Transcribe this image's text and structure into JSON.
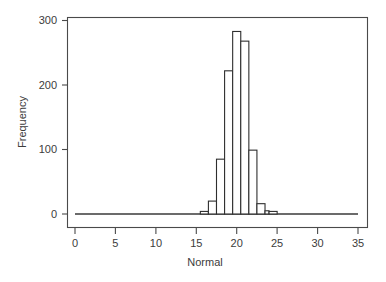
{
  "chart_data": {
    "type": "bar",
    "title": "",
    "subtitle": "",
    "xlabel": "Normal",
    "ylabel": "Frequency",
    "xlim": [
      0,
      35
    ],
    "ylim": [
      0,
      300
    ],
    "grid": false,
    "legend": null,
    "xticks": [
      0,
      5,
      10,
      15,
      20,
      25,
      30,
      35
    ],
    "xtick_labels": [
      "0",
      "5",
      "10",
      "15",
      "20",
      "25",
      "30",
      "35"
    ],
    "yticks": [
      0,
      100,
      200,
      300
    ],
    "ytick_labels": [
      "0",
      "100",
      "200",
      "300"
    ],
    "bin_width": 1,
    "bin_starts": [
      15.5,
      16.5,
      17.5,
      18.5,
      19.5,
      20.5,
      21.5,
      22.5,
      23.5,
      24.0
    ],
    "categories": [
      "15.5-16.5",
      "16.5-17.5",
      "17.5-18.5",
      "18.5-19.5",
      "19.5-20.5",
      "20.5-21.5",
      "21.5-22.5",
      "22.5-23.5",
      "23.5-24.5",
      "24.0-25.0"
    ],
    "values": [
      4,
      20,
      85,
      222,
      283,
      268,
      99,
      16,
      5,
      4
    ],
    "series": [
      {
        "name": "Frequency",
        "values": [
          4,
          20,
          85,
          222,
          283,
          268,
          99,
          16,
          5,
          4
        ]
      }
    ]
  },
  "figure": {
    "axes": {
      "x_axis_name": "Normal",
      "y_axis_name": "Frequency"
    },
    "colors": {
      "bar_fill": "#ffffff",
      "bar_stroke": "#2e2e2e",
      "frame": "#4a4a4a",
      "text": "#3c3c3c",
      "background": "#ffffff"
    }
  }
}
